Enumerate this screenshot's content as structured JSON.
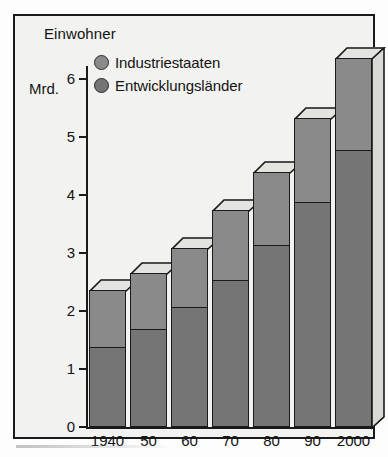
{
  "chart_data": {
    "type": "bar",
    "subtype": "stacked-3d-column",
    "title": "Einwohner",
    "ylabel": "Mrd.",
    "xlabel": "",
    "categories": [
      "1940",
      "50",
      "60",
      "70",
      "80",
      "90",
      "2000"
    ],
    "ylim": [
      0,
      6
    ],
    "ytick_labels": [
      "0",
      "1",
      "2",
      "3",
      "4",
      "5",
      "6"
    ],
    "ytick_values": [
      0,
      1,
      2,
      3,
      4,
      5,
      6
    ],
    "grid": false,
    "legend_position": "top-left-inside",
    "series": [
      {
        "name": "Entwicklungsländer",
        "color": "#757575",
        "values": [
          1.38,
          1.69,
          2.07,
          2.53,
          3.14,
          3.88,
          4.78
        ]
      },
      {
        "name": "Industriestaaten",
        "color": "#8a8a8a",
        "values": [
          0.98,
          0.97,
          1.02,
          1.21,
          1.26,
          1.45,
          1.58
        ]
      }
    ],
    "totals": [
      2.36,
      2.66,
      3.09,
      3.74,
      4.4,
      5.33,
      6.36
    ]
  },
  "legend": {
    "items": [
      {
        "label": "Industriestaaten",
        "color": "#8a8a8a"
      },
      {
        "label": "Entwicklungsländer",
        "color": "#757575"
      }
    ]
  },
  "colors": {
    "ink": "#1a1a1a",
    "plot_background": "#f2f2f0",
    "page_background": "#fdfdfd",
    "bar_upper": "#8a8a8a",
    "bar_lower": "#757575",
    "bar_top_face": "#e3e3e0"
  }
}
